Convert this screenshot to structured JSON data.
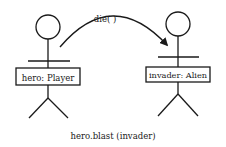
{
  "diagram": {
    "type": "uml-object-interaction",
    "actors": [
      {
        "id": "hero",
        "label": "hero: Player"
      },
      {
        "id": "invader",
        "label": "invader: Alien"
      }
    ],
    "message": {
      "from": "hero",
      "to": "invader",
      "label": "die( )"
    },
    "caption": "hero.blast (invader)",
    "colors": {
      "stroke": "#1a1a1a",
      "background": "#ffffff"
    }
  }
}
